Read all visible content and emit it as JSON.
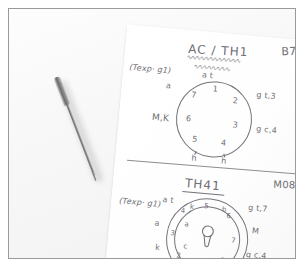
{
  "scene": {
    "description": "photo-of-handwritten-notes",
    "background_color": "#f5f5f5",
    "frame_color": "#9a9a9a",
    "paper_color": "#ffffff",
    "ink_color": "#6e6e74",
    "pen_color": "#8e8e8e"
  },
  "note_top": {
    "corner_code": "B7",
    "title": "AC / TH1",
    "left_annotation": "(Texp· g1)",
    "left_label_outer": "a",
    "left_label_lower": "M,K",
    "right_label_upper": "g t,3",
    "right_label_lower": "g c,4",
    "top_label": "a t",
    "dial": {
      "numbers": [
        "1",
        "2",
        "3",
        "4",
        "5",
        "6",
        "7"
      ],
      "bottom_marks": [
        "h",
        "h"
      ]
    }
  },
  "note_bottom": {
    "corner_code": "M08",
    "title": "TH41",
    "left_annotation": "(Texp· g1)",
    "left_label_upper": "a t",
    "left_label_outer": "a",
    "left_label_lower": "k",
    "right_label_upper": "g t,7",
    "right_label_mid": "M",
    "right_label_lower": "g c,4",
    "dial": {
      "outer_numbers": [
        "1",
        "2",
        "3",
        "4",
        "5",
        "6",
        "7",
        "8"
      ],
      "inner_letters": [
        "a",
        "c",
        "k",
        "b"
      ],
      "bottom_marks": [
        "h",
        "h"
      ],
      "center_icon": "keyhole-icon"
    }
  }
}
